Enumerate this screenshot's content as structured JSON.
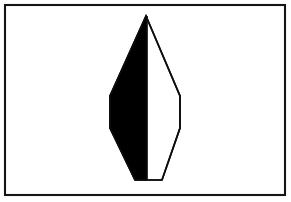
{
  "image": {
    "kind": "line-drawing",
    "title": "Bisected elongated hexagon figure",
    "background_color": "#ffffff",
    "ink_color": "#000000"
  },
  "frame": {
    "name": "rectangular-border",
    "stroke_color": "#151515",
    "stroke_width": 2.1,
    "x": 5,
    "y": 5,
    "width": 280,
    "height": 190
  },
  "figure": {
    "name": "bisected-hexagon",
    "outline_color": "#0d0d0d",
    "outline_width": 1.7,
    "left_half_fill": "#000000",
    "right_half_fill": "#ffffff",
    "apex": {
      "x": 146,
      "y": 16
    },
    "bottom_left": {
      "x": 135,
      "y": 180
    },
    "bottom_right": {
      "x": 162,
      "y": 180
    },
    "left_upper_vertex": {
      "x": 110,
      "y": 96
    },
    "left_lower_vertex": {
      "x": 110,
      "y": 128
    },
    "right_upper_vertex": {
      "x": 180,
      "y": 96
    },
    "right_lower_vertex": {
      "x": 180,
      "y": 128
    },
    "midline_top": {
      "x": 147,
      "y": 16
    },
    "midline_bottom": {
      "x": 147,
      "y": 180
    },
    "outline_path": "M146,16 L110,96 L110,128 L135,180 L162,180 L180,128 L180,96 Z",
    "dark_half_path": "M146,16 L110,96 L110,128 L135,180 L147,180 L147,16 Z",
    "midline_path": "M147,16 L147,180"
  }
}
